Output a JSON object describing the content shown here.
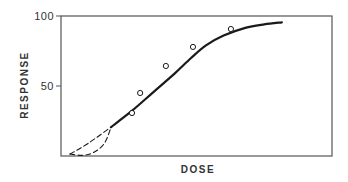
{
  "chart_data": {
    "type": "line",
    "title": "",
    "xlabel": "DOSE",
    "ylabel": "RESPONSE",
    "xlim": [
      0,
      100
    ],
    "ylim": [
      0,
      100
    ],
    "grid": false,
    "legend": null,
    "x_ticks": [],
    "y_ticks": [
      {
        "value": 50,
        "label": "50"
      },
      {
        "value": 100,
        "label": "100"
      }
    ],
    "series": [
      {
        "name": "fitted response curve",
        "style": "solid",
        "points": [
          {
            "x": 18.5,
            "y": 20.7
          },
          {
            "x": 26.0,
            "y": 32.0
          },
          {
            "x": 34.0,
            "y": 45.5
          },
          {
            "x": 42.0,
            "y": 59.0
          },
          {
            "x": 48.0,
            "y": 70.0
          },
          {
            "x": 53.5,
            "y": 79.0
          },
          {
            "x": 60.0,
            "y": 86.0
          },
          {
            "x": 68.0,
            "y": 91.5
          },
          {
            "x": 75.0,
            "y": 94.0
          },
          {
            "x": 81.5,
            "y": 95.5
          }
        ]
      },
      {
        "name": "low-dose extrapolation (linear)",
        "style": "dashed",
        "points": [
          {
            "x": 3.3,
            "y": 1.4
          },
          {
            "x": 10.0,
            "y": 9.0
          },
          {
            "x": 18.5,
            "y": 20.7
          }
        ]
      },
      {
        "name": "low-dose extrapolation (threshold)",
        "style": "dashed",
        "points": [
          {
            "x": 3.3,
            "y": 1.4
          },
          {
            "x": 8.0,
            "y": 0.5
          },
          {
            "x": 12.0,
            "y": 2.5
          },
          {
            "x": 16.0,
            "y": 9.0
          },
          {
            "x": 18.5,
            "y": 20.7
          }
        ]
      },
      {
        "name": "observed data",
        "style": "markers-open-circle",
        "points": [
          {
            "x": 26.2,
            "y": 30.7
          },
          {
            "x": 29.2,
            "y": 45.0
          },
          {
            "x": 38.7,
            "y": 64.3
          },
          {
            "x": 48.7,
            "y": 77.9
          },
          {
            "x": 62.7,
            "y": 90.7
          }
        ]
      }
    ]
  },
  "colors": {
    "line": "#1a1a1a",
    "axis": "#555555",
    "text": "#333333"
  }
}
